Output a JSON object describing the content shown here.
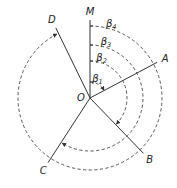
{
  "diagram": {
    "center": {
      "label": "O",
      "x": 90,
      "y": 98
    },
    "rays": [
      {
        "label": "M",
        "angle_deg": 0,
        "length": 78
      },
      {
        "label": "A",
        "angle_deg": 62,
        "length": 76
      },
      {
        "label": "B",
        "angle_deg": 136,
        "length": 77
      },
      {
        "label": "C",
        "angle_deg": 213,
        "length": 77
      },
      {
        "label": "D",
        "angle_deg": 334,
        "length": 78
      }
    ],
    "angles": [
      {
        "label": "β",
        "subscript": "1",
        "from": "M",
        "to": "A",
        "radius": 16
      },
      {
        "label": "β",
        "subscript": "2",
        "from": "M",
        "to": "B",
        "radius": 37
      },
      {
        "label": "β",
        "subscript": "3",
        "from": "M",
        "to": "C",
        "radius": 53
      },
      {
        "label": "β",
        "subscript": "4",
        "from": "M",
        "to": "D",
        "radius": 72
      }
    ],
    "style": {
      "line_color": "#333333",
      "arc_color": "#444444",
      "arc_dashed": true
    }
  }
}
